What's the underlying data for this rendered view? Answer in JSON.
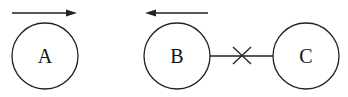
{
  "diagram": {
    "stroke_color": "#222222",
    "background": "#ffffff",
    "nodes": [
      {
        "id": "A",
        "label": "A",
        "cx": 45,
        "cy": 56,
        "r": 33
      },
      {
        "id": "B",
        "label": "B",
        "cx": 177,
        "cy": 56,
        "r": 33
      },
      {
        "id": "C",
        "label": "C",
        "cx": 306,
        "cy": 56,
        "r": 33
      }
    ],
    "arrows": [
      {
        "name": "arrow-right-above-A",
        "direction": "right",
        "x1": 12,
        "x2": 77,
        "y": 13
      },
      {
        "name": "arrow-left-above-B",
        "direction": "left",
        "x1": 208,
        "x2": 145,
        "y": 13
      }
    ],
    "edges": [
      {
        "from": "B",
        "to": "C",
        "marker": "cross",
        "cut": true
      }
    ]
  }
}
